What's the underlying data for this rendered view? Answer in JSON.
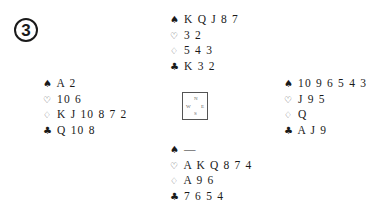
{
  "deal_number": "3",
  "suit_symbols": {
    "spades": "♠",
    "hearts": "♡",
    "diamonds": "♢",
    "clubs": "♣"
  },
  "compass": {
    "north": "N",
    "south": "S",
    "east": "E",
    "west": "W"
  },
  "hands": {
    "north": {
      "spades": "K Q J 8 7",
      "hearts": "3 2",
      "diamonds": "5 4 3",
      "clubs": "K 3 2"
    },
    "west": {
      "spades": "A 2",
      "hearts": "10 6",
      "diamonds": "K J 10 8 7 2",
      "clubs": "Q 10 8"
    },
    "east": {
      "spades": "10 9 6 5 4 3",
      "hearts": "J 9 5",
      "diamonds": "Q",
      "clubs": "A J 9"
    },
    "south": {
      "spades": "—",
      "hearts": "A K Q 8 7 4",
      "diamonds": "A 9 6",
      "clubs": "7 6 5 4"
    }
  }
}
